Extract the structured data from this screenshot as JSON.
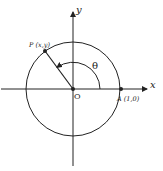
{
  "diagram": {
    "type": "unit-circle",
    "axes": {
      "x_label": "x",
      "y_label": "y"
    },
    "origin": {
      "label": "O"
    },
    "points": [
      {
        "id": "P",
        "label": "P (x,y)"
      },
      {
        "id": "A",
        "label": "A (1,0)"
      }
    ],
    "angle": {
      "label": "θ"
    },
    "colors": {
      "stroke": "#222222",
      "background": "#ffffff"
    }
  }
}
